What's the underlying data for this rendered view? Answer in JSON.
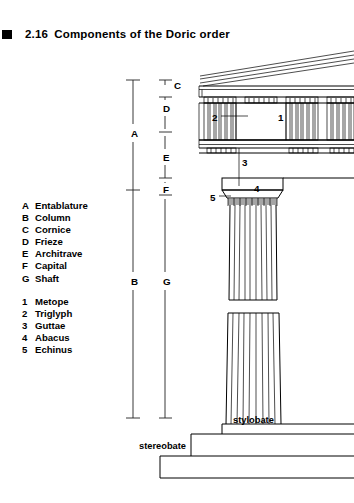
{
  "figure": {
    "number": "2.16",
    "title": "Components of the Doric order",
    "bullet_icon": "square-bullet-icon"
  },
  "legend": {
    "letters": [
      {
        "key": "A",
        "label": "Entablature"
      },
      {
        "key": "B",
        "label": "Column"
      },
      {
        "key": "C",
        "label": "Cornice"
      },
      {
        "key": "D",
        "label": "Frieze"
      },
      {
        "key": "E",
        "label": "Architrave"
      },
      {
        "key": "F",
        "label": "Capital"
      },
      {
        "key": "G",
        "label": "Shaft"
      }
    ],
    "numbers": [
      {
        "key": "1",
        "label": "Metope"
      },
      {
        "key": "2",
        "label": "Triglyph"
      },
      {
        "key": "3",
        "label": "Guttae"
      },
      {
        "key": "4",
        "label": "Abacus"
      },
      {
        "key": "5",
        "label": "Echinus"
      }
    ]
  },
  "dimension_labels": {
    "A": "A",
    "B": "B",
    "C": "C",
    "D": "D",
    "E": "E",
    "F": "F",
    "G": "G"
  },
  "callouts": {
    "one": "1",
    "two": "2",
    "three": "3",
    "four": "4",
    "five": "5"
  },
  "base_captions": {
    "stylobate": "stylobate",
    "stereobate": "stereobate"
  },
  "colors": {
    "ink": "#000000",
    "paper": "#ffffff",
    "dimension_line": "#222222"
  }
}
